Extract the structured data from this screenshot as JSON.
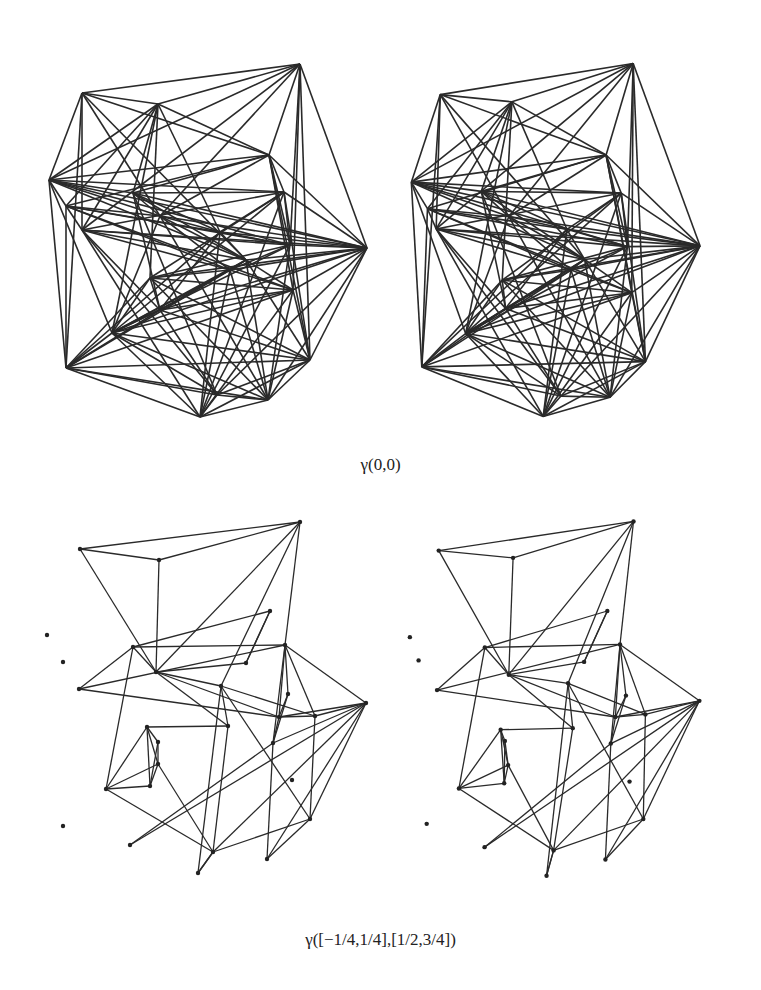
{
  "figure": {
    "top_caption": "γ(0,0)",
    "bottom_caption": "γ([−1/4,1/4],[1/2,3/4])",
    "line_color": "#2a2a2a",
    "background": "#ffffff"
  },
  "panels": [
    {
      "id": "top-left",
      "type": "dense-graph",
      "offset": [
        0,
        0
      ]
    },
    {
      "id": "top-right",
      "type": "dense-graph",
      "offset": [
        346,
        0
      ]
    },
    {
      "id": "bottom-left",
      "type": "sparse-graph",
      "offset": [
        0,
        0
      ]
    },
    {
      "id": "bottom-right",
      "type": "sparse-graph",
      "offset": [
        346,
        0
      ]
    }
  ],
  "dense_vertices": [
    [
      300,
      64
    ],
    [
      82,
      93
    ],
    [
      158,
      104
    ],
    [
      269,
      155
    ],
    [
      49,
      180
    ],
    [
      133,
      193
    ],
    [
      160,
      216
    ],
    [
      66,
      206
    ],
    [
      82,
      230
    ],
    [
      284,
      192
    ],
    [
      220,
      232
    ],
    [
      246,
      260
    ],
    [
      290,
      245
    ],
    [
      367,
      248
    ],
    [
      230,
      270
    ],
    [
      150,
      278
    ],
    [
      160,
      310
    ],
    [
      112,
      333
    ],
    [
      293,
      290
    ],
    [
      66,
      368
    ],
    [
      217,
      395
    ],
    [
      268,
      400
    ],
    [
      200,
      417
    ],
    [
      310,
      360
    ]
  ],
  "dense_edges": [
    [
      0,
      1
    ],
    [
      0,
      2
    ],
    [
      0,
      3
    ],
    [
      0,
      13
    ],
    [
      0,
      4
    ],
    [
      0,
      8
    ],
    [
      0,
      6
    ],
    [
      0,
      12
    ],
    [
      0,
      18
    ],
    [
      0,
      23
    ],
    [
      1,
      2
    ],
    [
      1,
      4
    ],
    [
      1,
      3
    ],
    [
      1,
      8
    ],
    [
      1,
      11
    ],
    [
      1,
      19
    ],
    [
      1,
      6
    ],
    [
      2,
      3
    ],
    [
      2,
      4
    ],
    [
      2,
      7
    ],
    [
      2,
      8
    ],
    [
      2,
      5
    ],
    [
      2,
      15
    ],
    [
      2,
      10
    ],
    [
      2,
      17
    ],
    [
      3,
      4
    ],
    [
      3,
      13
    ],
    [
      3,
      5
    ],
    [
      3,
      9
    ],
    [
      3,
      12
    ],
    [
      3,
      18
    ],
    [
      3,
      23
    ],
    [
      3,
      7
    ],
    [
      3,
      6
    ],
    [
      4,
      5
    ],
    [
      4,
      6
    ],
    [
      4,
      7
    ],
    [
      4,
      19
    ],
    [
      4,
      12
    ],
    [
      4,
      11
    ],
    [
      4,
      9
    ],
    [
      4,
      17
    ],
    [
      4,
      13
    ],
    [
      5,
      6
    ],
    [
      5,
      10
    ],
    [
      5,
      11
    ],
    [
      5,
      9
    ],
    [
      5,
      13
    ],
    [
      5,
      20
    ],
    [
      5,
      16
    ],
    [
      6,
      7
    ],
    [
      6,
      11
    ],
    [
      6,
      13
    ],
    [
      6,
      14
    ],
    [
      6,
      17
    ],
    [
      6,
      21
    ],
    [
      6,
      10
    ],
    [
      7,
      8
    ],
    [
      7,
      12
    ],
    [
      7,
      10
    ],
    [
      7,
      14
    ],
    [
      7,
      19
    ],
    [
      7,
      18
    ],
    [
      8,
      9
    ],
    [
      8,
      13
    ],
    [
      8,
      11
    ],
    [
      8,
      14
    ],
    [
      8,
      16
    ],
    [
      8,
      20
    ],
    [
      8,
      22
    ],
    [
      8,
      12
    ],
    [
      9,
      10
    ],
    [
      9,
      12
    ],
    [
      9,
      13
    ],
    [
      9,
      17
    ],
    [
      9,
      15
    ],
    [
      9,
      22
    ],
    [
      9,
      23
    ],
    [
      10,
      11
    ],
    [
      10,
      12
    ],
    [
      10,
      13
    ],
    [
      10,
      16
    ],
    [
      10,
      19
    ],
    [
      10,
      22
    ],
    [
      11,
      13
    ],
    [
      11,
      14
    ],
    [
      11,
      16
    ],
    [
      11,
      17
    ],
    [
      11,
      21
    ],
    [
      11,
      23
    ],
    [
      11,
      18
    ],
    [
      12,
      13
    ],
    [
      12,
      14
    ],
    [
      12,
      15
    ],
    [
      12,
      17
    ],
    [
      12,
      21
    ],
    [
      12,
      22
    ],
    [
      13,
      14
    ],
    [
      13,
      15
    ],
    [
      13,
      16
    ],
    [
      13,
      18
    ],
    [
      13,
      20
    ],
    [
      13,
      21
    ],
    [
      13,
      23
    ],
    [
      13,
      17
    ],
    [
      14,
      15
    ],
    [
      14,
      17
    ],
    [
      14,
      19
    ],
    [
      14,
      21
    ],
    [
      14,
      22
    ],
    [
      14,
      18
    ],
    [
      15,
      16
    ],
    [
      15,
      17
    ],
    [
      15,
      19
    ],
    [
      15,
      21
    ],
    [
      15,
      23
    ],
    [
      15,
      18
    ],
    [
      16,
      17
    ],
    [
      16,
      19
    ],
    [
      16,
      23
    ],
    [
      16,
      20
    ],
    [
      16,
      18
    ],
    [
      17,
      18
    ],
    [
      17,
      19
    ],
    [
      17,
      21
    ],
    [
      17,
      22
    ],
    [
      17,
      23
    ],
    [
      17,
      20
    ],
    [
      18,
      19
    ],
    [
      18,
      21
    ],
    [
      18,
      22
    ],
    [
      18,
      23
    ],
    [
      19,
      20
    ],
    [
      19,
      22
    ],
    [
      19,
      21
    ],
    [
      19,
      23
    ],
    [
      20,
      21
    ],
    [
      20,
      22
    ],
    [
      20,
      23
    ],
    [
      21,
      22
    ],
    [
      21,
      23
    ],
    [
      22,
      23
    ]
  ],
  "sparse_vertices": [
    [
      300,
      522
    ],
    [
      80,
      549
    ],
    [
      159,
      560
    ],
    [
      270,
      611
    ],
    [
      47,
      635
    ],
    [
      63,
      662
    ],
    [
      133,
      647
    ],
    [
      156,
      672
    ],
    [
      246,
      663
    ],
    [
      79,
      689
    ],
    [
      221,
      686
    ],
    [
      285,
      645
    ],
    [
      288,
      694
    ],
    [
      366,
      703
    ],
    [
      279,
      717
    ],
    [
      228,
      726
    ],
    [
      315,
      716
    ],
    [
      273,
      743
    ],
    [
      147,
      727
    ],
    [
      158,
      742
    ],
    [
      158,
      764
    ],
    [
      150,
      786
    ],
    [
      106,
      789
    ],
    [
      292,
      780
    ],
    [
      63,
      826
    ],
    [
      310,
      819
    ],
    [
      130,
      845
    ],
    [
      213,
      852
    ],
    [
      267,
      859
    ],
    [
      198,
      873
    ]
  ],
  "sparse_edges": [
    [
      0,
      2
    ],
    [
      0,
      10
    ],
    [
      0,
      11
    ],
    [
      0,
      7
    ],
    [
      0,
      1
    ],
    [
      1,
      2
    ],
    [
      1,
      7
    ],
    [
      2,
      7
    ],
    [
      3,
      6
    ],
    [
      3,
      8
    ],
    [
      6,
      7
    ],
    [
      6,
      11
    ],
    [
      6,
      9
    ],
    [
      6,
      22
    ],
    [
      7,
      8
    ],
    [
      7,
      14
    ],
    [
      7,
      10
    ],
    [
      7,
      15
    ],
    [
      9,
      11
    ],
    [
      9,
      14
    ],
    [
      8,
      3
    ],
    [
      10,
      15
    ],
    [
      10,
      29
    ],
    [
      10,
      16
    ],
    [
      10,
      25
    ],
    [
      11,
      14
    ],
    [
      11,
      16
    ],
    [
      11,
      17
    ],
    [
      11,
      13
    ],
    [
      11,
      12
    ],
    [
      12,
      14
    ],
    [
      12,
      17
    ],
    [
      13,
      14
    ],
    [
      13,
      16
    ],
    [
      13,
      17
    ],
    [
      13,
      25
    ],
    [
      13,
      26
    ],
    [
      13,
      28
    ],
    [
      13,
      27
    ],
    [
      14,
      17
    ],
    [
      14,
      16
    ],
    [
      15,
      18
    ],
    [
      15,
      27
    ],
    [
      17,
      26
    ],
    [
      17,
      28
    ],
    [
      16,
      25
    ],
    [
      18,
      19
    ],
    [
      18,
      20
    ],
    [
      18,
      21
    ],
    [
      18,
      22
    ],
    [
      19,
      21
    ],
    [
      19,
      20
    ],
    [
      20,
      22
    ],
    [
      20,
      27
    ],
    [
      20,
      21
    ],
    [
      21,
      22
    ],
    [
      22,
      27
    ],
    [
      27,
      29
    ],
    [
      27,
      25
    ],
    [
      25,
      28
    ],
    [
      29,
      27
    ]
  ],
  "sparse_isolated": [
    4,
    5,
    23,
    24,
    26
  ]
}
